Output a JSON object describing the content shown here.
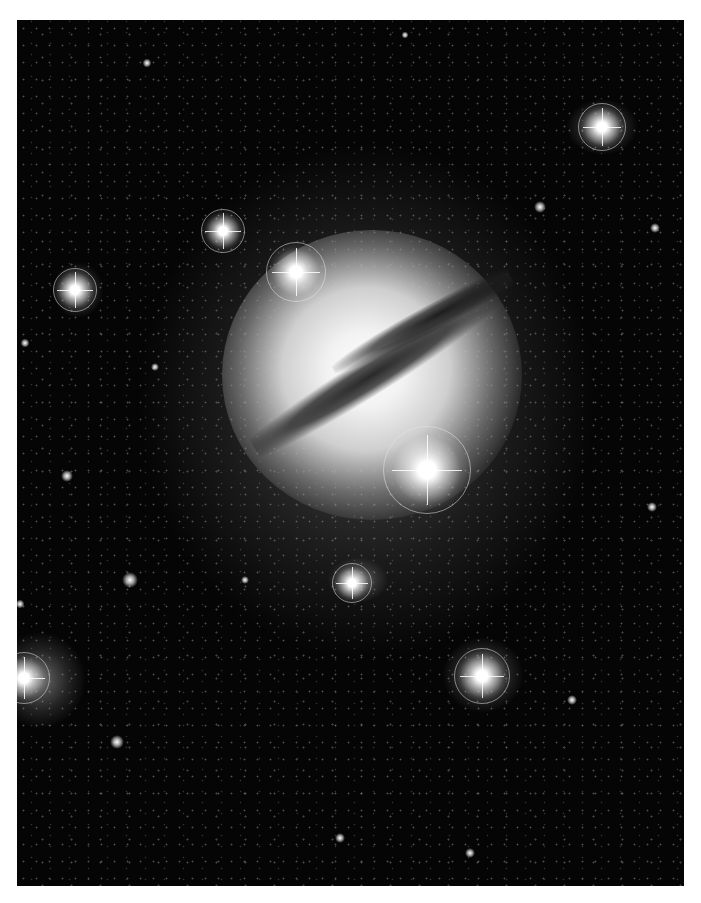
{
  "image": {
    "description": "Grayscale astronomical photograph of an elliptical galaxy with a dark diagonal dust lane, surrounded by foreground stars with diffraction spikes and halos",
    "frame": {
      "left": 17,
      "top": 20,
      "width": 667,
      "height": 866
    },
    "background_color": "#050505",
    "border_color": "#ffffff",
    "bright_stars": [
      {
        "x": 296,
        "y": 272,
        "size": 60
      },
      {
        "x": 427,
        "y": 470,
        "size": 88
      },
      {
        "x": 223,
        "y": 231,
        "size": 44
      },
      {
        "x": 75,
        "y": 290,
        "size": 44
      },
      {
        "x": 602,
        "y": 127,
        "size": 48
      },
      {
        "x": 482,
        "y": 676,
        "size": 56
      },
      {
        "x": 24,
        "y": 678,
        "size": 52
      },
      {
        "x": 352,
        "y": 583,
        "size": 40
      }
    ],
    "fuzzy_objects": [
      {
        "x": 602,
        "y": 127,
        "w": 70,
        "h": 55
      },
      {
        "x": 40,
        "y": 680,
        "w": 90,
        "h": 95
      },
      {
        "x": 483,
        "y": 675,
        "w": 80,
        "h": 75
      },
      {
        "x": 78,
        "y": 290,
        "w": 50,
        "h": 55
      },
      {
        "x": 358,
        "y": 580,
        "w": 60,
        "h": 45
      }
    ],
    "small_stars": [
      {
        "x": 540,
        "y": 207,
        "s": 12
      },
      {
        "x": 655,
        "y": 228,
        "s": 10
      },
      {
        "x": 147,
        "y": 63,
        "s": 9
      },
      {
        "x": 67,
        "y": 476,
        "s": 12
      },
      {
        "x": 130,
        "y": 580,
        "s": 16
      },
      {
        "x": 652,
        "y": 507,
        "s": 10
      },
      {
        "x": 572,
        "y": 700,
        "s": 10
      },
      {
        "x": 117,
        "y": 742,
        "s": 14
      },
      {
        "x": 340,
        "y": 838,
        "s": 10
      },
      {
        "x": 25,
        "y": 343,
        "s": 9
      },
      {
        "x": 20,
        "y": 604,
        "s": 9
      },
      {
        "x": 245,
        "y": 580,
        "s": 8
      },
      {
        "x": 155,
        "y": 367,
        "s": 8
      },
      {
        "x": 470,
        "y": 853,
        "s": 10
      },
      {
        "x": 405,
        "y": 35,
        "s": 7
      }
    ]
  }
}
